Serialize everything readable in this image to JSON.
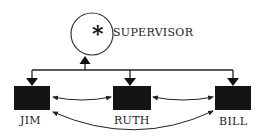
{
  "diagram": {
    "supervisor": {
      "label": "SUPERVISOR",
      "symbol": "*"
    },
    "subordinates": [
      {
        "label": "JIM"
      },
      {
        "label": "RUTH"
      },
      {
        "label": "BILL"
      }
    ],
    "colors": {
      "box": "#141414",
      "line": "#222222",
      "background": "#ffffff"
    }
  }
}
